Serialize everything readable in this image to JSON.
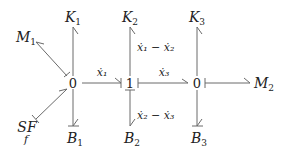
{
  "diagram": {
    "type": "bond-graph",
    "junctions": [
      {
        "id": "j0a",
        "label": "0"
      },
      {
        "id": "j1",
        "label": "1"
      },
      {
        "id": "j0b",
        "label": "0"
      }
    ],
    "elements": [
      {
        "id": "K1",
        "base": "K",
        "sub": "1"
      },
      {
        "id": "K2",
        "base": "K",
        "sub": "2"
      },
      {
        "id": "K3",
        "base": "K",
        "sub": "3"
      },
      {
        "id": "M1",
        "base": "M",
        "sub": "1"
      },
      {
        "id": "M2",
        "base": "M",
        "sub": "2"
      },
      {
        "id": "B1",
        "base": "B",
        "sub": "1"
      },
      {
        "id": "B2",
        "base": "B",
        "sub": "2"
      },
      {
        "id": "B3",
        "base": "B",
        "sub": "3"
      },
      {
        "id": "SF",
        "base": "SF",
        "sub": "f"
      }
    ],
    "flow_labels": {
      "x1": "ẋ₁",
      "x3": "ẋ₃",
      "x1_minus_x2": "ẋ₁ − ẋ₂",
      "x2_minus_x3": "ẋ₂ − ẋ₃"
    },
    "bonds": [
      {
        "from": "j0a",
        "to": "K1"
      },
      {
        "from": "j0a",
        "to": "M1"
      },
      {
        "from": "j0a",
        "to": "B1"
      },
      {
        "from": "SF",
        "to": "j0a"
      },
      {
        "from": "j0a",
        "to": "j1",
        "label": "x1"
      },
      {
        "from": "j1",
        "to": "K2",
        "label": "x1_minus_x2"
      },
      {
        "from": "j1",
        "to": "B2",
        "label": "x2_minus_x3"
      },
      {
        "from": "j0b",
        "to": "j1",
        "label": "x3"
      },
      {
        "from": "j0b",
        "to": "K3"
      },
      {
        "from": "j0b",
        "to": "B3"
      },
      {
        "from": "j0b",
        "to": "M2"
      }
    ]
  }
}
